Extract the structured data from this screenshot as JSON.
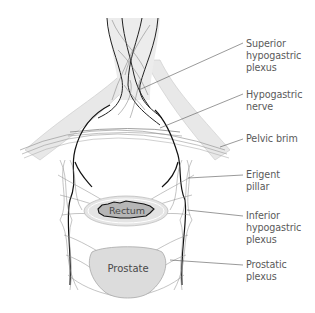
{
  "figure": {
    "colors": {
      "background": "#ffffff",
      "pelvic_band": "#e6e6e6",
      "nerve_dark": "#1a1a1a",
      "nerve_light": "#8c8c8c",
      "rectum_outer": "#e2e2e2",
      "rectum_inner": "#b4b4b4",
      "prostate_fill": "#dcdcdc",
      "label_text": "#5a5a5a",
      "leader_line": "#555555"
    }
  },
  "organs": {
    "rectum": "Rectum",
    "prostate": "Prostate"
  },
  "labels": [
    {
      "id": "superior-hypogastric-plexus",
      "text": "Superior\nhypogastric\nplexus",
      "anchor": [
        141,
        89
      ],
      "label_pos": [
        246,
        36
      ]
    },
    {
      "id": "hypogastric-nerve",
      "text": "Hypogastric\nnerve",
      "anchor": [
        160,
        128
      ],
      "label_pos": [
        246,
        90
      ]
    },
    {
      "id": "pelvic-brim",
      "text": "Pelvic brim",
      "anchor": [
        220,
        147
      ],
      "label_pos": [
        246,
        133
      ]
    },
    {
      "id": "erigent-pillar",
      "text": "Erigent\npillar",
      "anchor": [
        188,
        178
      ],
      "label_pos": [
        246,
        170
      ]
    },
    {
      "id": "inferior-hypogastric-plexus",
      "text": "Inferior\nhypogastric\nplexus",
      "anchor": [
        187,
        210
      ],
      "label_pos": [
        246,
        211
      ]
    },
    {
      "id": "prostatic-plexus",
      "text": "Prostatic\nplexus",
      "anchor": [
        170,
        260
      ],
      "label_pos": [
        246,
        261
      ]
    }
  ]
}
